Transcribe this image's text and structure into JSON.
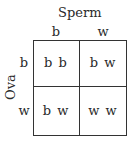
{
  "title": "Sperm",
  "row_axis_label": "Ova",
  "columns": [
    "b",
    "w"
  ],
  "rows": [
    "b",
    "w"
  ],
  "cells": [
    [
      "b b",
      "b w"
    ],
    [
      "b w",
      "w w"
    ]
  ]
}
